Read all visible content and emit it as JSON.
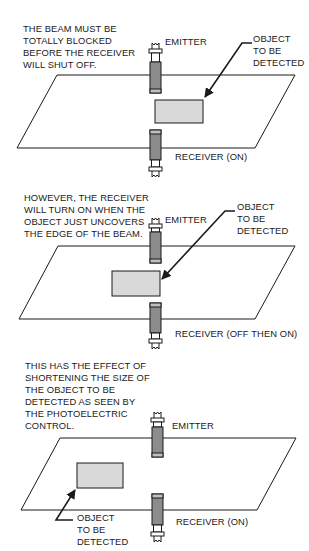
{
  "colors": {
    "line": "#1a1a1a",
    "object_fill": "#d9d9d9",
    "sensor_body": "#8c8c8c",
    "sensor_band": "#bfbfbf",
    "background": "#ffffff"
  },
  "panels": [
    {
      "id": "panel-1",
      "caption": "THE BEAM MUST BE\nTOTALLY BLOCKED\nBEFORE THE RECEIVER\nWILL SHUT OFF.",
      "caption_pos": [
        23,
        27
      ],
      "emitter_label": "EMITTER",
      "emitter_label_pos": [
        165,
        40
      ],
      "receiver_label": "RECEIVER (ON)",
      "receiver_label_pos": [
        175,
        155
      ],
      "object_label": "OBJECT\nTO BE\nDETECTED",
      "object_label_pos": [
        253,
        37
      ],
      "plane": [
        [
          57,
          75
        ],
        [
          295,
          75
        ],
        [
          255,
          148
        ],
        [
          17,
          148
        ]
      ],
      "object_box": [
        155,
        100,
        48,
        23
      ],
      "arrow": [
        [
          252,
          43
        ],
        [
          242,
          43
        ],
        [
          205,
          97
        ]
      ],
      "sensor_x": 150,
      "emitter_top": 43,
      "emitter_body": [
        62,
        93
      ],
      "receiver_body": [
        130,
        160
      ],
      "receiver_bottom": 177
    },
    {
      "id": "panel-2",
      "caption": "HOWEVER, THE RECEIVER\nWILL TURN ON WHEN THE\nOBJECT JUST UNCOVERS\nTHE EDGE OF THE BEAM.",
      "caption_pos": [
        24,
        196
      ],
      "emitter_label": "EMITTER",
      "emitter_label_pos": [
        165,
        218
      ],
      "receiver_label": "RECEIVER (OFF THEN ON)",
      "receiver_label_pos": [
        175,
        332
      ],
      "object_label": "OBJECT\nTO BE\nDETECTED",
      "object_label_pos": [
        237,
        205
      ],
      "plane": [
        [
          58,
          246
        ],
        [
          295,
          246
        ],
        [
          255,
          319
        ],
        [
          19,
          319
        ]
      ],
      "object_box": [
        112,
        271,
        48,
        25
      ],
      "arrow": [
        [
          235,
          211
        ],
        [
          225,
          211
        ],
        [
          162,
          279
        ]
      ],
      "sensor_x": 150,
      "emitter_top": 218,
      "emitter_body": [
        232,
        263
      ],
      "receiver_body": [
        303,
        333
      ],
      "receiver_bottom": 349
    },
    {
      "id": "panel-3",
      "caption": "THIS HAS THE EFFECT OF\nSHORTENING THE SIZE OF\nTHE OBJECT TO BE\nDETECTED AS SEEN BY\nTHE PHOTOELECTRIC\nCONTROL.",
      "caption_pos": [
        25,
        364
      ],
      "emitter_label": "EMITTER",
      "emitter_label_pos": [
        172,
        424
      ],
      "receiver_label": "RECEIVER (ON)",
      "receiver_label_pos": [
        176,
        520
      ],
      "object_label": "OBJECT\nTO BE\nDETECTED",
      "object_label_pos": [
        77,
        516
      ],
      "plane": [
        [
          60,
          438
        ],
        [
          296,
          438
        ],
        [
          257,
          510
        ],
        [
          21,
          510
        ]
      ],
      "object_box": [
        77,
        463,
        46,
        25
      ],
      "arrow": [
        [
          73,
          520
        ],
        [
          56,
          520
        ],
        [
          75,
          490
        ]
      ],
      "sensor_x": 152,
      "emitter_top": 412,
      "emitter_body": [
        427,
        457
      ],
      "receiver_body": [
        494,
        525
      ],
      "receiver_bottom": 542
    }
  ]
}
